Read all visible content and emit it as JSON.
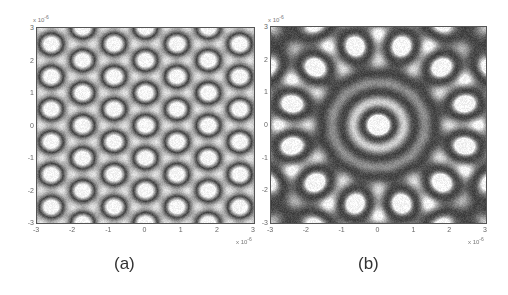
{
  "figure": {
    "panels": [
      {
        "id": "a",
        "caption": "(a)",
        "y_ticks": [
          "3",
          "2",
          "1",
          "0",
          "-1",
          "-2",
          "-3"
        ],
        "x_ticks": [
          "-3",
          "-2",
          "-1",
          "0",
          "1",
          "2",
          "3"
        ],
        "y_exponent_label": "x 10",
        "y_exponent_power": "-6",
        "x_exponent_label": "x 10",
        "x_exponent_power": "-6",
        "pattern": "periodic-interference-lattice"
      },
      {
        "id": "b",
        "caption": "(b)",
        "y_ticks": [
          "3",
          "2",
          "1",
          "0",
          "-1",
          "-2",
          "-3"
        ],
        "x_ticks": [
          "-3",
          "-2",
          "-1",
          "0",
          "1",
          "2",
          "3"
        ],
        "y_exponent_label": "x 10",
        "y_exponent_power": "-6",
        "x_exponent_label": "x 10",
        "x_exponent_power": "-6",
        "pattern": "12-fold-quasicrystal-interference"
      }
    ]
  },
  "chart_data": [
    {
      "type": "heatmap",
      "title": "(a)",
      "xlabel": "",
      "ylabel": "",
      "x_ticks": [
        -3,
        -2,
        -1,
        0,
        1,
        2,
        3
      ],
      "y_ticks": [
        -3,
        -2,
        -1,
        0,
        1,
        2,
        3
      ],
      "xlim": [
        -3,
        3
      ],
      "ylim": [
        -3,
        3
      ],
      "axis_multiplier": "x 10^-6",
      "colormap": "gray",
      "description": "Grayscale intensity pattern of bright rings and blobs arranged in a quasi-periodic lattice"
    },
    {
      "type": "heatmap",
      "title": "(b)",
      "xlabel": "",
      "ylabel": "",
      "x_ticks": [
        -3,
        -2,
        -1,
        0,
        1,
        2,
        3
      ],
      "y_ticks": [
        -3,
        -2,
        -1,
        0,
        1,
        2,
        3
      ],
      "xlim": [
        -3,
        3
      ],
      "ylim": [
        -3,
        3
      ],
      "axis_multiplier": "x 10^-6",
      "colormap": "gray",
      "description": "Grayscale 12-fold rotationally symmetric quasicrystal interference pattern with central ring at origin"
    }
  ]
}
